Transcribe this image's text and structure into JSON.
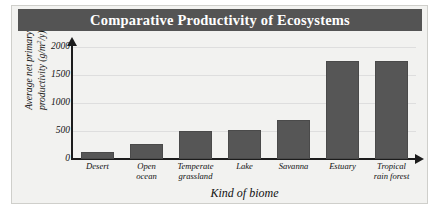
{
  "chart_data": {
    "type": "bar",
    "title": "Comparative Productivity of Ecosystems",
    "xlabel": "Kind of biome",
    "ylabel": "Average net primary productivity (g/m²/y)",
    "ylabel_main": "Average net primary",
    "ylabel_unit_prefix": "productivity (g/m",
    "ylabel_unit_sup": "2",
    "ylabel_unit_suffix": "/y)",
    "categories": [
      "Desert",
      "Open ocean",
      "Temperate grassland",
      "Lake",
      "Savanna",
      "Estuary",
      "Tropical rain forest"
    ],
    "category_lines": [
      [
        "Desert"
      ],
      [
        "Open",
        "ocean"
      ],
      [
        "Temperate",
        "grassland"
      ],
      [
        "Lake"
      ],
      [
        "Savanna"
      ],
      [
        "Estuary"
      ],
      [
        "Tropical",
        "rain forest"
      ]
    ],
    "values": [
      125,
      270,
      500,
      510,
      690,
      1750,
      1750
    ],
    "ylim": [
      0,
      2000
    ],
    "yticks": [
      0,
      500,
      1000,
      1500,
      2000
    ],
    "ytick_labels": [
      "0",
      "500",
      "1000",
      "1500",
      "2000"
    ],
    "grid": true,
    "legend": null,
    "bar_color": "#565656",
    "axis_color": "#1c1c1c",
    "gridline_color": "#dedede",
    "title_banner_color": "#545454",
    "title_text_color": "#ffffff",
    "panel_color": "#f2f2f0"
  }
}
